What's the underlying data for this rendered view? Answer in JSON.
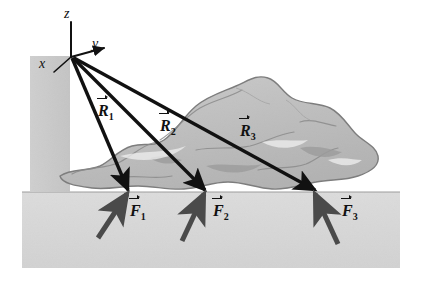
{
  "figure": {
    "background_color": "#ffffff",
    "floor_color": "#d6d6d6",
    "wall_color": "#c9c9c9",
    "rock_fill": "#c0c0c0",
    "rock_outline": "#7a7a7a",
    "vector_color": "#111111",
    "force_color": "#4a4a4a"
  },
  "axes": {
    "origin": {
      "x": 71,
      "y": 57
    },
    "labels": [
      {
        "id": "z",
        "text": "z",
        "x": 66,
        "y": 13
      },
      {
        "id": "y",
        "text": "y",
        "x": 92,
        "y": 44
      },
      {
        "id": "x",
        "text": "x",
        "x": 40,
        "y": 63
      }
    ]
  },
  "position_vectors": [
    {
      "id": "R1",
      "symbol": "R",
      "subscript": "1",
      "label_x": 98,
      "label_y": 103,
      "from": {
        "x": 71,
        "y": 57
      },
      "to": {
        "x": 130,
        "y": 190
      }
    },
    {
      "id": "R2",
      "symbol": "R",
      "subscript": "2",
      "label_x": 160,
      "label_y": 118,
      "from": {
        "x": 71,
        "y": 57
      },
      "to": {
        "x": 207,
        "y": 190
      }
    },
    {
      "id": "R3",
      "symbol": "R",
      "subscript": "3",
      "label_x": 240,
      "label_y": 123,
      "from": {
        "x": 71,
        "y": 57
      },
      "to": {
        "x": 317,
        "y": 190
      }
    }
  ],
  "force_vectors": [
    {
      "id": "F1",
      "symbol": "F",
      "subscript": "1",
      "label_x": 130,
      "label_y": 203,
      "from": {
        "x": 98,
        "y": 238
      },
      "to": {
        "x": 128,
        "y": 193
      }
    },
    {
      "id": "F2",
      "symbol": "F",
      "subscript": "2",
      "label_x": 213,
      "label_y": 203,
      "from": {
        "x": 182,
        "y": 240
      },
      "to": {
        "x": 205,
        "y": 193
      }
    },
    {
      "id": "F3",
      "symbol": "F",
      "subscript": "3",
      "label_x": 342,
      "label_y": 203,
      "from": {
        "x": 338,
        "y": 243
      },
      "to": {
        "x": 314,
        "y": 193
      }
    }
  ],
  "contact_points": [
    {
      "id": "P1",
      "x": 128,
      "y": 192
    },
    {
      "id": "P2",
      "x": 205,
      "y": 192
    },
    {
      "id": "P3",
      "x": 315,
      "y": 192
    }
  ],
  "surfaces": {
    "floor": {
      "left": 22,
      "top": 192,
      "right": 400,
      "bottom": 268
    },
    "wall": {
      "left": 30,
      "top": 56,
      "right": 70,
      "bottom": 192
    }
  }
}
